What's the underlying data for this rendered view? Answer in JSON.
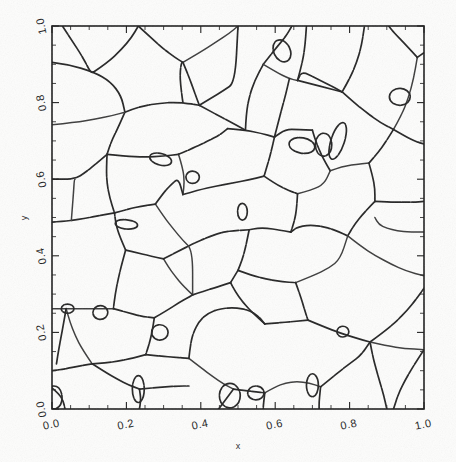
{
  "figure": {
    "background_color": "#fdfdfc",
    "line_color": "#242424",
    "axis_color": "#1c1c1c",
    "width": 456,
    "height": 462
  },
  "chart_data": {
    "type": "line",
    "title": "",
    "subtitle": "",
    "xlabel": "x",
    "ylabel": "y",
    "xlim": [
      0.0,
      1.0
    ],
    "ylim": [
      0.0,
      1.0
    ],
    "xticks": [
      0.0,
      0.2,
      0.4,
      0.6,
      0.8,
      1.0
    ],
    "yticks": [
      0.0,
      0.2,
      0.4,
      0.6,
      0.8,
      1.0
    ],
    "xticklabels": [
      "0.0",
      "0.2",
      "0.4",
      "0.6",
      "0.8",
      "1.0"
    ],
    "yticklabels": [
      "0.0",
      "0.2",
      "0.4",
      "0.6",
      "0.8",
      "1.0"
    ],
    "minor_tick_step": 0.05,
    "tick_direction": "in",
    "grid": false,
    "legend": null,
    "legend_position": "none",
    "annotations": [],
    "series": [
      {
        "name": "grain-boundary-network",
        "cell_count": 64,
        "paths": [
          "M 0.000 0.905 L 0.042 0.900 L 0.112 0.880 L 0.157 0.855 L 0.186 0.818 L 0.196 0.775",
          "M 0.196 0.775 L 0.234 0.790 L 0.300 0.800 L 0.352 0.800 L 0.396 0.793",
          "M 0.196 0.775 L 0.178 0.735 L 0.160 0.700 L 0.148 0.665",
          "M 0.000 0.742 L 0.062 0.748 L 0.118 0.757 L 0.162 0.766 L 0.196 0.775",
          "M 0.028 1.000 L 0.055 0.960 L 0.083 0.918 L 0.104 0.878 L 0.112 0.880",
          "M 0.112 0.880 L 0.150 0.905 L 0.186 0.938 L 0.214 0.970 L 0.232 1.000",
          "M 0.232 1.000 L 0.268 0.968 L 0.300 0.940 L 0.330 0.918 L 0.352 0.905",
          "M 0.352 0.905 L 0.368 0.868 L 0.382 0.830 L 0.396 0.793",
          "M 0.352 0.905 L 0.400 0.932 L 0.444 0.960 L 0.478 0.982 L 0.500 1.000",
          "M 0.396 0.793 L 0.440 0.770 L 0.482 0.748 L 0.520 0.728",
          "M 0.148 0.665 L 0.196 0.660 L 0.250 0.658 L 0.300 0.660 L 0.340 0.665",
          "M 0.148 0.665 L 0.118 0.640 L 0.090 0.618 L 0.062 0.600 L 0.000 0.600",
          "M 0.148 0.665 L 0.146 0.625 L 0.148 0.588 L 0.155 0.552 L 0.168 0.512",
          "M 0.340 0.665 L 0.352 0.628 L 0.356 0.592 L 0.352 0.560",
          "M 0.340 0.665 L 0.382 0.682 L 0.420 0.700 L 0.452 0.716 L 0.472 0.732",
          "M 0.472 0.732 L 0.520 0.728 L 0.562 0.720 L 0.598 0.710",
          "M 0.520 0.728 L 0.522 0.770 L 0.530 0.815 L 0.545 0.858 L 0.568 0.900",
          "M 0.568 0.900 L 0.600 0.940 L 0.628 0.972 L 0.645 1.000",
          "M 0.568 0.900 L 0.606 0.878 L 0.638 0.862 L 0.660 0.858",
          "M 0.660 0.858 L 0.672 0.900 L 0.680 0.945 L 0.684 1.000",
          "M 0.660 0.858 L 0.700 0.848 L 0.740 0.838 L 0.780 0.828",
          "M 0.780 0.828 L 0.800 0.862 L 0.818 0.902 L 0.832 0.948 L 0.840 1.000",
          "M 0.780 0.828 L 0.812 0.800 L 0.848 0.772 L 0.882 0.748 L 0.918 0.730",
          "M 0.918 0.730 L 0.940 0.768 L 0.958 0.812 L 0.972 0.862 L 0.982 0.918",
          "M 0.982 0.918 L 1.000 0.930",
          "M 0.982 0.918 L 0.950 0.952 L 0.920 0.982 L 0.905 1.000",
          "M 0.918 0.730 L 0.950 0.712 L 0.978 0.698 L 1.000 0.692",
          "M 0.918 0.730 L 0.898 0.698 L 0.875 0.668 L 0.852 0.642",
          "M 0.852 0.642 L 0.812 0.638 L 0.778 0.632 L 0.748 0.622",
          "M 0.748 0.622 L 0.730 0.652 L 0.716 0.682 L 0.706 0.708 L 0.700 0.728",
          "M 0.700 0.728 L 0.660 0.730 L 0.628 0.730 L 0.598 0.710",
          "M 0.598 0.710 L 0.590 0.675 L 0.580 0.640 L 0.570 0.608",
          "M 0.570 0.608 L 0.600 0.588 L 0.632 0.572 L 0.660 0.562",
          "M 0.660 0.562 L 0.700 0.572 L 0.732 0.588 L 0.748 0.622",
          "M 0.660 0.562 L 0.658 0.525 L 0.652 0.492 L 0.642 0.462",
          "M 0.852 0.642 L 0.862 0.608 L 0.868 0.575 L 0.868 0.542",
          "M 0.868 0.542 L 0.905 0.540 L 0.940 0.540 L 0.972 0.540 L 1.000 0.542",
          "M 0.868 0.542 L 0.838 0.512 L 0.812 0.480 L 0.795 0.452",
          "M 0.795 0.452 L 0.830 0.425 L 0.870 0.400 L 0.912 0.378 L 0.952 0.360 L 1.000 0.348",
          "M 0.795 0.452 L 0.760 0.468 L 0.722 0.478 L 0.688 0.480 L 0.660 0.475 L 0.642 0.462",
          "M 0.642 0.462 L 0.608 0.468 L 0.578 0.472 L 0.552 0.472 L 0.530 0.468",
          "M 0.530 0.468 L 0.522 0.428 L 0.512 0.392 L 0.500 0.362",
          "M 0.500 0.362 L 0.540 0.348 L 0.582 0.338 L 0.620 0.332 L 0.655 0.330",
          "M 0.655 0.330 L 0.702 0.348 L 0.745 0.368 L 0.775 0.392 L 0.795 0.452",
          "M 0.655 0.330 L 0.668 0.295 L 0.678 0.262 L 0.688 0.232",
          "M 0.688 0.232 L 0.730 0.215 L 0.775 0.198 L 0.818 0.185 L 0.855 0.175",
          "M 0.855 0.175 L 0.890 0.200 L 0.925 0.228 L 0.955 0.258 L 0.980 0.288 L 1.000 0.315",
          "M 0.855 0.175 L 0.862 0.138 L 0.872 0.102 L 0.882 0.068 L 0.892 0.035 L 0.900 0.000",
          "M 0.855 0.175 L 0.900 0.165 L 0.948 0.158 L 1.000 0.155",
          "M 0.688 0.232 L 0.645 0.228 L 0.608 0.225 L 0.572 0.222",
          "M 0.572 0.222 L 0.540 0.250 L 0.512 0.280 L 0.492 0.308 L 0.480 0.330",
          "M 0.480 0.330 L 0.500 0.362",
          "M 0.480 0.330 L 0.442 0.318 L 0.408 0.308 L 0.378 0.298",
          "M 0.378 0.298 L 0.352 0.322 L 0.330 0.348 L 0.312 0.372 L 0.300 0.392",
          "M 0.300 0.392 L 0.340 0.412 L 0.380 0.432 L 0.418 0.448 L 0.452 0.460 L 0.480 0.465 L 0.530 0.468",
          "M 0.300 0.392 L 0.262 0.400 L 0.228 0.408 L 0.198 0.415",
          "M 0.198 0.415 L 0.182 0.450 L 0.172 0.482 L 0.168 0.512",
          "M 0.168 0.512 L 0.205 0.522 L 0.242 0.530 L 0.278 0.535",
          "M 0.278 0.535 L 0.302 0.500 L 0.328 0.468 L 0.352 0.440 L 0.378 0.415 L 0.378 0.298",
          "M 0.278 0.535 L 0.300 0.565 L 0.322 0.588 L 0.340 0.602 L 0.352 0.560",
          "M 0.352 0.560 L 0.395 0.572 L 0.440 0.582 L 0.485 0.590 L 0.528 0.598 L 0.570 0.608",
          "M 0.168 0.512 L 0.128 0.505 L 0.090 0.498 L 0.052 0.492 L 0.000 0.488",
          "M 0.198 0.415 L 0.188 0.380 L 0.178 0.340 L 0.170 0.300 L 0.165 0.262",
          "M 0.165 0.262 L 0.128 0.262 L 0.090 0.262 L 0.048 0.262 L 0.000 0.262",
          "M 0.165 0.262 L 0.202 0.252 L 0.240 0.242 L 0.275 0.238",
          "M 0.275 0.238 L 0.310 0.258 L 0.342 0.278 L 0.368 0.292 L 0.378 0.298",
          "M 0.275 0.238 L 0.270 0.205 L 0.262 0.172 L 0.252 0.142",
          "M 0.252 0.142 L 0.292 0.138 L 0.332 0.135 L 0.368 0.132",
          "M 0.368 0.132 L 0.400 0.108 L 0.432 0.085 L 0.462 0.065 L 0.488 0.052",
          "M 0.488 0.052 L 0.520 0.048 L 0.548 0.045 L 0.572 0.042",
          "M 0.488 0.052 L 0.465 0.022 L 0.448 0.000",
          "M 0.368 0.132 L 0.372 0.168 L 0.380 0.200 L 0.395 0.228 L 0.418 0.250 L 0.452 0.262 L 0.492 0.265 L 0.530 0.258 L 0.555 0.242 L 0.572 0.222",
          "M 0.252 0.142 L 0.215 0.132 L 0.178 0.125 L 0.142 0.120 L 0.108 0.118",
          "M 0.108 0.118 L 0.082 0.155 L 0.062 0.192 L 0.048 0.228 L 0.038 0.262",
          "M 0.108 0.118 L 0.072 0.112 L 0.038 0.105 L 0.000 0.100",
          "M 0.108 0.118 L 0.140 0.098 L 0.175 0.078 L 0.208 0.062 L 0.235 0.052",
          "M 0.235 0.052 L 0.238 0.035 L 0.238 0.018 L 0.235 0.000",
          "M 0.235 0.052 L 0.270 0.055 L 0.305 0.058 L 0.340 0.060 L 0.368 0.060",
          "M 0.572 0.042 L 0.600 0.058 L 0.628 0.068 L 0.658 0.072 L 0.692 0.068 L 0.722 0.058",
          "M 0.722 0.058 L 0.750 0.080 L 0.778 0.102 L 0.805 0.122 L 0.830 0.140 L 0.855 0.175",
          "M 0.722 0.058 L 0.720 0.038 L 0.718 0.018 L 0.718 0.000",
          "M 0.572 0.042 L 0.570 0.025 L 0.568 0.008 L 0.568 0.000",
          "M 0.000 0.055 L 0.018 0.040 L 0.030 0.022 L 0.035 0.000",
          "M 1.000 0.462 L 0.962 0.462 L 0.928 0.465 L 0.900 0.472 L 0.878 0.482 L 0.868 0.500",
          "M 0.352 0.800 L 0.346 0.840 L 0.344 0.878 L 0.348 0.905 L 0.352 0.905",
          "M 0.396 0.793 L 0.428 0.812 L 0.462 0.832 L 0.492 0.852 L 0.500 1.000",
          "M 0.598 0.710 L 0.608 0.748 L 0.618 0.785 L 0.628 0.820 L 0.638 0.862",
          "M 0.780 0.828 L 0.742 0.848 L 0.706 0.865 L 0.672 0.882 L 0.660 0.858",
          "M 0.052 0.492 L 0.055 0.530 L 0.058 0.568 L 0.060 0.600 L 0.062 0.600",
          "M 1.000 0.155 L 0.975 0.118 L 0.952 0.080 L 0.932 0.042 L 0.918 0.000",
          "M 0.038 0.262 L 0.032 0.228 L 0.025 0.192 L 0.018 0.155 L 0.012 0.118"
        ],
        "small_cells": [
          {
            "cx": 0.618,
            "cy": 0.935,
            "rx": 0.022,
            "ry": 0.03,
            "rot": -25
          },
          {
            "cx": 0.292,
            "cy": 0.652,
            "rx": 0.03,
            "ry": 0.015,
            "rot": 15
          },
          {
            "cx": 0.378,
            "cy": 0.605,
            "rx": 0.018,
            "ry": 0.016,
            "rot": 0
          },
          {
            "cx": 0.672,
            "cy": 0.688,
            "rx": 0.035,
            "ry": 0.02,
            "rot": 10
          },
          {
            "cx": 0.73,
            "cy": 0.69,
            "rx": 0.022,
            "ry": 0.03,
            "rot": 0
          },
          {
            "cx": 0.768,
            "cy": 0.7,
            "rx": 0.018,
            "ry": 0.05,
            "rot": 18
          },
          {
            "cx": 0.512,
            "cy": 0.515,
            "rx": 0.013,
            "ry": 0.022,
            "rot": 0
          },
          {
            "cx": 0.2,
            "cy": 0.482,
            "rx": 0.03,
            "ry": 0.012,
            "rot": 5
          },
          {
            "cx": 0.042,
            "cy": 0.262,
            "rx": 0.017,
            "ry": 0.012,
            "rot": 0
          },
          {
            "cx": 0.13,
            "cy": 0.252,
            "rx": 0.02,
            "ry": 0.018,
            "rot": 0
          },
          {
            "cx": 0.29,
            "cy": 0.2,
            "rx": 0.022,
            "ry": 0.02,
            "rot": 0
          },
          {
            "cx": 0.478,
            "cy": 0.035,
            "rx": 0.028,
            "ry": 0.032,
            "rot": 0
          },
          {
            "cx": 0.548,
            "cy": 0.042,
            "rx": 0.022,
            "ry": 0.018,
            "rot": 0
          },
          {
            "cx": 0.7,
            "cy": 0.062,
            "rx": 0.016,
            "ry": 0.03,
            "rot": 0
          },
          {
            "cx": 0.232,
            "cy": 0.052,
            "rx": 0.016,
            "ry": 0.035,
            "rot": 0
          },
          {
            "cx": 0.005,
            "cy": 0.03,
            "rx": 0.022,
            "ry": 0.03,
            "rot": 0
          },
          {
            "cx": 0.935,
            "cy": 0.815,
            "rx": 0.028,
            "ry": 0.022,
            "rot": 0
          },
          {
            "cx": 0.782,
            "cy": 0.202,
            "rx": 0.016,
            "ry": 0.014,
            "rot": 0
          }
        ]
      }
    ]
  },
  "axes": {
    "x_axis_label": "x",
    "y_axis_label": "y"
  }
}
